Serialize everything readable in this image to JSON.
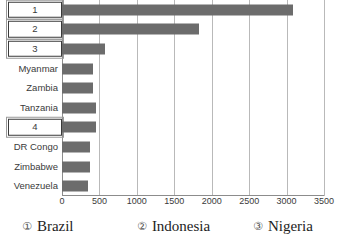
{
  "chart_data": {
    "type": "bar",
    "orientation": "horizontal",
    "title": "",
    "xlabel": "",
    "ylabel": "",
    "xlim": [
      0,
      3500
    ],
    "xticks": [
      0,
      500,
      1000,
      1500,
      2000,
      2500,
      3000,
      3500
    ],
    "xtick_labels": [
      "0",
      "500",
      "1000",
      "1500",
      "2000",
      "2500",
      "3000",
      "3500"
    ],
    "grid": true,
    "legend_position": "bottom",
    "categories": [
      "1",
      "2",
      "3",
      "Myanmar",
      "Zambia",
      "Tanzania",
      "4",
      "DR Congo",
      "Zimbabwe",
      "Venezuela"
    ],
    "category_boxed": [
      true,
      true,
      true,
      false,
      false,
      false,
      true,
      false,
      false,
      false
    ],
    "values": [
      3080,
      1830,
      570,
      420,
      420,
      450,
      450,
      380,
      375,
      350
    ],
    "series": [
      {
        "name": "",
        "values": [
          3080,
          1830,
          570,
          420,
          420,
          450,
          450,
          380,
          375,
          350
        ]
      }
    ],
    "legend": [
      {
        "marker": "①",
        "label": "Brazil"
      },
      {
        "marker": "②",
        "label": "Indonesia"
      },
      {
        "marker": "③",
        "label": "Nigeria"
      }
    ],
    "colors": {
      "bar": "#6c6c6c",
      "grid": "#b9b9b9",
      "axis": "#8c8c8c",
      "text": "#3a3a3a",
      "legend_text": "#1d1d1d",
      "background": "#ffffff"
    }
  }
}
